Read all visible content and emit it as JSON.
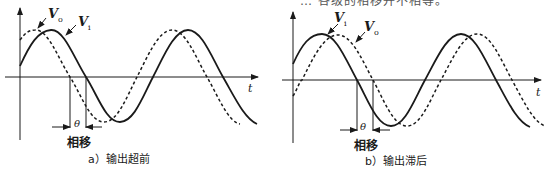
{
  "top_text": "… 各级的相移并不相等。",
  "panels": [
    {
      "id": "a",
      "caption": "a）输出超前",
      "time_axis_label": "t",
      "theta_label": "θ",
      "phase_label": "相移",
      "vo_label": "V",
      "vo_sub": "o",
      "vi_label": "V",
      "vi_sub": "i",
      "description": "Output Vo (dashed) leads input Vi (solid)"
    },
    {
      "id": "b",
      "caption": "b）输出滞后",
      "time_axis_label": "t",
      "theta_label": "θ",
      "phase_label": "相移",
      "vo_label": "V",
      "vo_sub": "o",
      "vi_label": "V",
      "vi_sub": "i",
      "description": "Output Vo (dashed) lags input Vi (solid)"
    }
  ],
  "colors": {
    "line": "#1a1a1a",
    "background": "#ffffff"
  }
}
